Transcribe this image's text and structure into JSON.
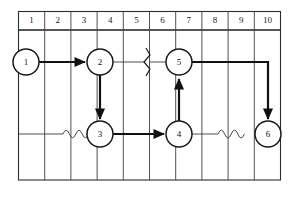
{
  "figure": {
    "kind": "network-diagram",
    "background_color": "#ffffff",
    "line_color": "#1a1a1a",
    "grid_color": "#3d3d3d"
  },
  "time_scale": {
    "label": "time units",
    "columns": [
      {
        "index": 1,
        "label": "1"
      },
      {
        "index": 2,
        "label": "2"
      },
      {
        "index": 3,
        "label": "3"
      },
      {
        "index": 4,
        "label": "4"
      },
      {
        "index": 5,
        "label": "5"
      },
      {
        "index": 6,
        "label": "6"
      },
      {
        "index": 7,
        "label": "7"
      },
      {
        "index": 8,
        "label": "8"
      },
      {
        "index": 9,
        "label": "9"
      },
      {
        "index": 10,
        "label": "10"
      }
    ]
  },
  "nodes": [
    {
      "id": "node-1",
      "label": "1",
      "cx": 26,
      "cy": 62,
      "r": 13
    },
    {
      "id": "node-2",
      "label": "2",
      "cx": 100,
      "cy": 62,
      "r": 13
    },
    {
      "id": "node-3",
      "label": "3",
      "cx": 100,
      "cy": 134,
      "r": 13
    },
    {
      "id": "node-4",
      "label": "4",
      "cx": 179,
      "cy": 134,
      "r": 13
    },
    {
      "id": "node-5",
      "label": "5",
      "cx": 179,
      "cy": 62,
      "r": 13
    },
    {
      "id": "node-6",
      "label": "6",
      "cx": 268,
      "cy": 134,
      "r": 13
    }
  ],
  "edges": [
    {
      "id": "edge-1-2",
      "from": "1",
      "to": "2",
      "style": "solid-thick",
      "arrow": true
    },
    {
      "id": "edge-2-5",
      "from": "2",
      "to": "5",
      "style": "dummy-with-break",
      "arrow": false
    },
    {
      "id": "edge-2-3",
      "from": "2",
      "to": "3",
      "style": "solid-thick",
      "arrow": true
    },
    {
      "id": "edge-slack-to-3",
      "from": "",
      "to": "3",
      "style": "wavy-slack",
      "arrow": true
    },
    {
      "id": "edge-3-4",
      "from": "3",
      "to": "4",
      "style": "solid-thick",
      "arrow": true
    },
    {
      "id": "edge-4-5",
      "from": "4",
      "to": "5",
      "style": "solid-thick",
      "arrow": true
    },
    {
      "id": "edge-4-6-slack",
      "from": "4",
      "to": "6",
      "style": "wavy-slack",
      "arrow": true
    },
    {
      "id": "edge-5-6",
      "from": "5",
      "to": "6",
      "style": "solid-thick-elbow",
      "arrow": true
    }
  ]
}
